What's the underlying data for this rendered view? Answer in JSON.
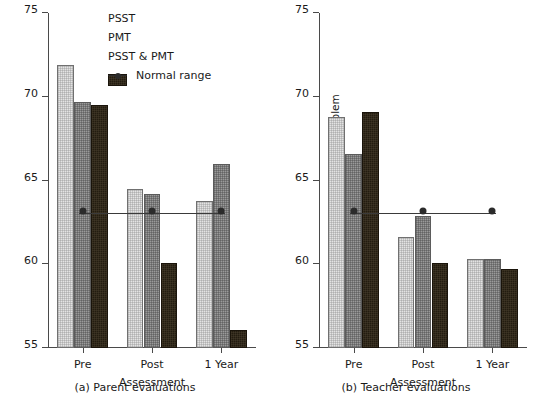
{
  "figure": {
    "legend": {
      "items": [
        {
          "label": "PSST",
          "kind": "swatch",
          "color": "#e3e3e3",
          "icon": "light-gray-square-icon"
        },
        {
          "label": "PMT",
          "kind": "swatch",
          "color": "#9a9a9a",
          "icon": "mid-gray-square-icon"
        },
        {
          "label": "PSST & PMT",
          "kind": "swatch",
          "color": "#231c10",
          "icon": "dark-square-icon"
        },
        {
          "label": "Normal range",
          "kind": "line",
          "color": "#2b2b2b",
          "icon": "line-with-dot-icon"
        }
      ]
    },
    "panels": [
      {
        "id": "a",
        "caption": "(a)  Parent evaluations",
        "ylabel": "CBCL total behavior problem",
        "xlabel": "Assessment"
      },
      {
        "id": "b",
        "caption": "(b)  Teacher evaluations",
        "ylabel": "CBCL-TRF total behavior problem",
        "xlabel": "Assessment"
      }
    ]
  },
  "chart_data": [
    {
      "type": "bar",
      "title": "(a)  Parent evaluations",
      "xlabel": "Assessment",
      "ylabel": "CBCL total behavior problem",
      "categories": [
        "Pre",
        "Post",
        "1 Year"
      ],
      "ylim": [
        55,
        75
      ],
      "yticks": [
        55,
        60,
        65,
        70,
        75
      ],
      "grid": false,
      "legend_position": "top-center",
      "series": [
        {
          "name": "PSST",
          "values": [
            71.9,
            64.5,
            63.8
          ]
        },
        {
          "name": "PMT",
          "values": [
            69.7,
            64.2,
            66.0
          ]
        },
        {
          "name": "PSST & PMT",
          "values": [
            69.5,
            60.1,
            56.1
          ]
        }
      ],
      "reference_line": {
        "name": "Normal range",
        "value": 63,
        "markers_at": [
          "Pre",
          "Post",
          "1 Year"
        ]
      }
    },
    {
      "type": "bar",
      "title": "(b)  Teacher evaluations",
      "xlabel": "Assessment",
      "ylabel": "CBCL-TRF total behavior problem",
      "categories": [
        "Pre",
        "Post",
        "1 Year"
      ],
      "ylim": [
        55,
        75
      ],
      "yticks": [
        55,
        60,
        65,
        70,
        75
      ],
      "grid": false,
      "legend_position": "none",
      "series": [
        {
          "name": "PSST",
          "values": [
            68.8,
            61.6,
            60.3
          ]
        },
        {
          "name": "PMT",
          "values": [
            66.6,
            62.9,
            60.3
          ]
        },
        {
          "name": "PSST & PMT",
          "values": [
            69.1,
            60.1,
            59.7
          ]
        }
      ],
      "reference_line": {
        "name": "Normal range",
        "value": 63,
        "markers_at": [
          "Pre",
          "Post",
          "1 Year"
        ]
      }
    }
  ]
}
